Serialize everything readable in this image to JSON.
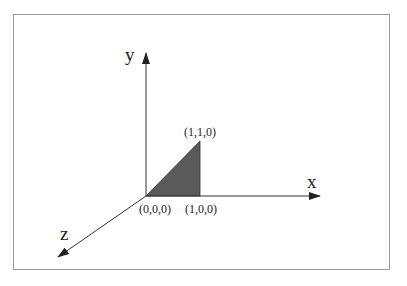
{
  "diagram": {
    "title": "",
    "colors": {
      "frame": "#9a9a9a",
      "axis": "#333333",
      "triangle_fill": "#5a5a5a",
      "text": "#222222"
    },
    "axes": [
      {
        "id": "x",
        "label": "x"
      },
      {
        "id": "y",
        "label": "y"
      },
      {
        "id": "z",
        "label": "z"
      }
    ],
    "points": [
      {
        "id": "origin",
        "label": "(0,0,0)"
      },
      {
        "id": "p100",
        "label": "(1,0,0)"
      },
      {
        "id": "p110",
        "label": "(1,1,0)"
      }
    ],
    "shapes": [
      {
        "type": "triangle",
        "vertices": [
          "(0,0,0)",
          "(1,0,0)",
          "(1,1,0)"
        ],
        "fill": "dark gray"
      }
    ]
  }
}
